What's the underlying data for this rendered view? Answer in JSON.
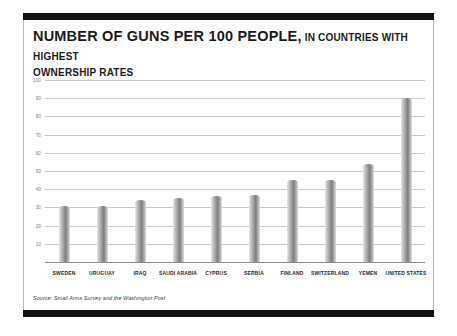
{
  "header": {
    "title_main": "NUMBER OF GUNS PER 100 PEOPLE,",
    "title_sub": " IN COUNTRIES WITH HIGHEST",
    "title_line2": "OWNERSHIP RATES"
  },
  "footer": {
    "source": "Source: Small Arms Survey and the Washington Post"
  },
  "colors": {
    "band": "#111111",
    "frame": "#b9b9b9",
    "gridline": "#c9c9c9",
    "baseline": "#8d8d8d",
    "bar_light": "#e9e9e9",
    "bar_dark": "#7e7e7e",
    "title_text": "#1b1b1b",
    "axis_text": "#7d7d7d",
    "label_text": "#2a2a2a"
  },
  "chart_data": {
    "type": "bar",
    "title": "NUMBER OF GUNS PER 100 PEOPLE, IN COUNTRIES WITH HIGHEST OWNERSHIP RATES",
    "xlabel": "",
    "ylabel": "",
    "ylim": [
      0,
      100
    ],
    "yticks": [
      10,
      20,
      30,
      40,
      50,
      60,
      70,
      80,
      90,
      100
    ],
    "grid": true,
    "legend": "none",
    "source": "Small Arms Survey and the Washington Post",
    "categories": [
      "SWEDEN",
      "URUGUAY",
      "IRAQ",
      "SAUDI ARABIA",
      "CYPRUS",
      "SERBIA",
      "FINLAND",
      "SWITZERLAND",
      "YEMEN",
      "UNITED STATES"
    ],
    "values": [
      31,
      31,
      34,
      35,
      36,
      37,
      45,
      45,
      54,
      90
    ]
  }
}
